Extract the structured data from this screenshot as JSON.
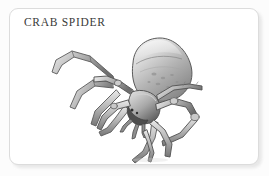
{
  "card": {
    "title": "CRAB SPIDER",
    "background_color": "#ffffff",
    "border_color": "#dcdcdc",
    "title_color": "#3a3a3a",
    "corner_radius_px": 9
  },
  "page": {
    "background_color": "#fcfcfc",
    "shadow_color": "#e4e4e4"
  },
  "illustration": {
    "subject": "crab-spider",
    "style": "grayscale graphite pencil drawing",
    "alt_text": "Crab spider with bulbous triangular abdomen and long angular outstretched legs",
    "palette": {
      "outline": "#4a4a4a",
      "dark_shade": "#6f6f6f",
      "mid_shade": "#9a9a9a",
      "light_shade": "#c8c8c8",
      "highlight": "#f1f1f1"
    }
  }
}
